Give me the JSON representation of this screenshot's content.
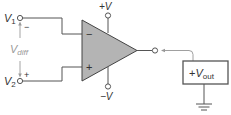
{
  "diagram": {
    "type": "op-amp-differential-input",
    "inputs": {
      "v1": {
        "label": "V",
        "subscript": "1",
        "polarity": "−"
      },
      "v2": {
        "label": "V",
        "subscript": "2",
        "polarity": "+"
      },
      "vdiff": {
        "label": "V",
        "subscript": "diff"
      }
    },
    "opamp": {
      "inverting_symbol": "−",
      "noninverting_symbol": "+",
      "fill_color": "#b4b4b4"
    },
    "supplies": {
      "positive": "+V",
      "negative": "−V"
    },
    "output_meter": {
      "prefix": "+",
      "label": "V",
      "subscript": "out",
      "border_color": "#555555"
    },
    "colors": {
      "wire": "#555555",
      "signal_wire": "#a0a0a0",
      "label": "#333333",
      "vdiff_label": "#9a9a9a"
    }
  }
}
